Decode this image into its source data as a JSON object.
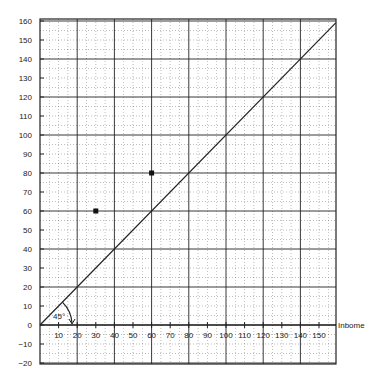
{
  "chart_data": {
    "type": "scatter",
    "title": "",
    "xlabel": "Inbome",
    "ylabel": "",
    "xlim": [
      0,
      159
    ],
    "ylim": [
      -20,
      160
    ],
    "x_ticks": [
      10,
      20,
      30,
      40,
      50,
      60,
      70,
      80,
      90,
      100,
      110,
      120,
      130,
      140,
      150
    ],
    "y_ticks": [
      -20,
      -10,
      0,
      10,
      20,
      30,
      40,
      50,
      60,
      70,
      80,
      90,
      100,
      110,
      120,
      130,
      140,
      150,
      160
    ],
    "grid": {
      "major_every": 20,
      "minor_every": 5,
      "major_style": "solid",
      "minor_style": "dotted"
    },
    "series": [
      {
        "name": "points",
        "type": "scatter",
        "marker": "square",
        "points": [
          {
            "x": 30,
            "y": 60
          },
          {
            "x": 60,
            "y": 80
          }
        ]
      },
      {
        "name": "45-degree line",
        "type": "line",
        "points": [
          {
            "x": 0,
            "y": 0
          },
          {
            "x": 159,
            "y": 159
          }
        ]
      }
    ],
    "annotations": [
      {
        "text": "45°",
        "x": 10,
        "y": 4,
        "note": "angle arc between x-axis and 45-degree line"
      }
    ],
    "legend": null
  },
  "labels": {
    "x_axis_title": "Inbome",
    "angle_label": "45°"
  }
}
